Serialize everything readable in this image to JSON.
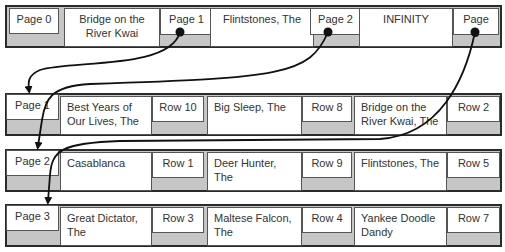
{
  "root": {
    "label": "Page 0",
    "entries": [
      {
        "key": "Bridge on the River Kwai",
        "pointer": "Page 1"
      },
      {
        "key": "Flintstones, The",
        "pointer": "Page 2"
      },
      {
        "key": "INFINITY",
        "pointer": "Page 3"
      }
    ]
  },
  "leaves": [
    {
      "label": "Page 1",
      "entries": [
        {
          "key": "Best Years of Our Lives, The",
          "row": "Row 10"
        },
        {
          "key": "Big Sleep, The",
          "row": "Row 8"
        },
        {
          "key": "Bridge on the River Kwai, The",
          "row": "Row 2"
        }
      ]
    },
    {
      "label": "Page 2",
      "entries": [
        {
          "key": "Casablanca",
          "row": "Row 1"
        },
        {
          "key": "Deer Hunter, The",
          "row": "Row 9"
        },
        {
          "key": "Flintstones, The",
          "row": "Row 5"
        }
      ]
    },
    {
      "label": "Page 3",
      "entries": [
        {
          "key": "Great Dictator, The",
          "row": "Row 3"
        },
        {
          "key": "Maltese Falcon, The",
          "row": "Row 4"
        },
        {
          "key": "Yankee Doodle Dandy",
          "row": "Row 7"
        }
      ]
    }
  ],
  "colors": {
    "bar_fill": "#c6c6c6",
    "border": "#2a2a2a",
    "arrow": "#111111"
  }
}
